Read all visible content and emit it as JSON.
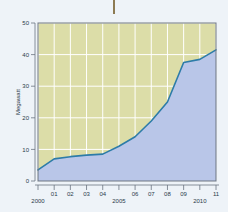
{
  "figure": {
    "background_color": "#eef3f8",
    "top_rule": {
      "name": "top-vertical-rule",
      "color": "#8c7a53"
    }
  },
  "chart_data": {
    "type": "area",
    "title": "",
    "subtitle": "",
    "xlabel": "",
    "ylabel": "Megawatt",
    "categories": [
      "2000",
      "01",
      "02",
      "03",
      "04",
      "2005",
      "06",
      "07",
      "08",
      "09",
      "2010",
      "11"
    ],
    "x_tick_labels": [
      "2000",
      "01",
      "02",
      "03",
      "04",
      "2005",
      "06",
      "07",
      "08",
      "09",
      "2010",
      "11"
    ],
    "y_tick_labels": [
      "0",
      "10",
      "20",
      "30",
      "40",
      "50"
    ],
    "y_ticks": [
      0,
      10,
      20,
      30,
      40,
      50
    ],
    "ylim": [
      0,
      50
    ],
    "xlim": [
      2000,
      2011
    ],
    "values": [
      3.5,
      7.0,
      7.7,
      8.2,
      8.5,
      11.0,
      14.0,
      19.0,
      25.0,
      37.5,
      38.5,
      41.5
    ],
    "series": [
      {
        "name": "Megawatt",
        "values": [
          3.5,
          7.0,
          7.7,
          8.2,
          8.5,
          11.0,
          14.0,
          19.0,
          25.0,
          37.5,
          38.5,
          41.5
        ]
      }
    ],
    "grid": true,
    "grid_color": "#ffffff",
    "legend": false,
    "legend_position": "none",
    "plot_background_color": "#dcdda8",
    "area_fill_color": "#b9c6e8",
    "line_color": "#2d7ca8",
    "axis_color": "#6b7480",
    "annotations": []
  }
}
